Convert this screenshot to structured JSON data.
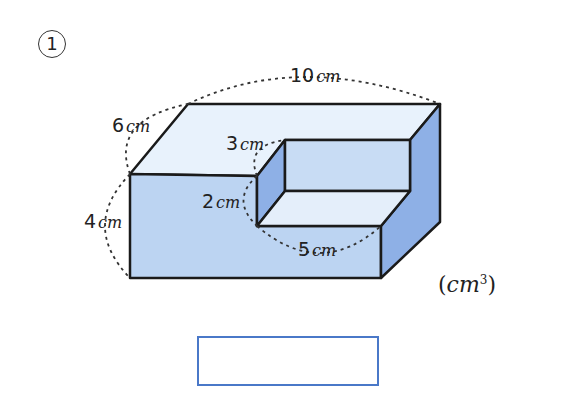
{
  "question": {
    "number": "1"
  },
  "dimensions": {
    "length": {
      "value": "10",
      "unit": "cm"
    },
    "depth": {
      "value": "6",
      "unit": "cm"
    },
    "height": {
      "value": "4",
      "unit": "cm"
    },
    "cut_depth": {
      "value": "3",
      "unit": "cm"
    },
    "cut_height": {
      "value": "2",
      "unit": "cm"
    },
    "cut_length": {
      "value": "5",
      "unit": "cm"
    }
  },
  "answer": {
    "unit": "cm",
    "unit_power": "3",
    "value": ""
  },
  "colors": {
    "top_face": "#e8f2fc",
    "front_face": "#bcd4f2",
    "side_face": "#8eb0e6",
    "inner_back": "#c8dcf4",
    "inner_floor": "#e4eefa",
    "answer_border": "#4a78c8"
  }
}
